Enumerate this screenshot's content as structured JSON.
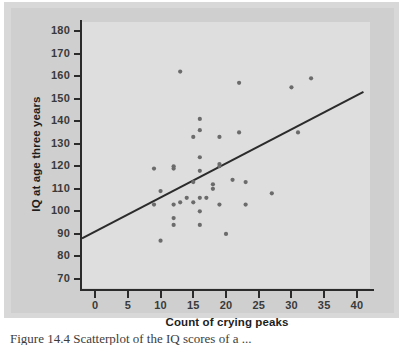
{
  "figure": {
    "caption": "Figure 14.4  Scatterplot of the IQ scores of a ..."
  },
  "chart_data": {
    "type": "scatter",
    "title": "",
    "xlabel": "Count of crying peaks",
    "ylabel": "IQ at age three years",
    "xlim": [
      -2,
      42
    ],
    "ylim": [
      66,
      184
    ],
    "xticks": [
      0,
      5,
      10,
      15,
      20,
      25,
      30,
      35,
      40
    ],
    "yticks": [
      70,
      80,
      90,
      100,
      110,
      120,
      130,
      140,
      150,
      160,
      170,
      180
    ],
    "grid": false,
    "legend": null,
    "marker_color": "#6b6b6b",
    "line_color": "#2b2b2b",
    "plot_background": "#dedede",
    "figure_background": "#cfcfcf",
    "points": [
      {
        "x": 9,
        "y": 119
      },
      {
        "x": 9,
        "y": 103
      },
      {
        "x": 10,
        "y": 109
      },
      {
        "x": 10,
        "y": 87
      },
      {
        "x": 12,
        "y": 120
      },
      {
        "x": 12,
        "y": 119
      },
      {
        "x": 12,
        "y": 103
      },
      {
        "x": 12,
        "y": 97
      },
      {
        "x": 12,
        "y": 94
      },
      {
        "x": 13,
        "y": 162
      },
      {
        "x": 13,
        "y": 104
      },
      {
        "x": 14,
        "y": 106
      },
      {
        "x": 15,
        "y": 133
      },
      {
        "x": 15,
        "y": 113
      },
      {
        "x": 15,
        "y": 104
      },
      {
        "x": 16,
        "y": 141
      },
      {
        "x": 16,
        "y": 136
      },
      {
        "x": 16,
        "y": 124
      },
      {
        "x": 16,
        "y": 118
      },
      {
        "x": 16,
        "y": 106
      },
      {
        "x": 16,
        "y": 100
      },
      {
        "x": 16,
        "y": 94
      },
      {
        "x": 17,
        "y": 106
      },
      {
        "x": 18,
        "y": 112
      },
      {
        "x": 18,
        "y": 110
      },
      {
        "x": 19,
        "y": 133
      },
      {
        "x": 19,
        "y": 121
      },
      {
        "x": 19,
        "y": 120
      },
      {
        "x": 19,
        "y": 103
      },
      {
        "x": 20,
        "y": 90
      },
      {
        "x": 21,
        "y": 114
      },
      {
        "x": 22,
        "y": 157
      },
      {
        "x": 22,
        "y": 135
      },
      {
        "x": 23,
        "y": 113
      },
      {
        "x": 23,
        "y": 103
      },
      {
        "x": 27,
        "y": 108
      },
      {
        "x": 30,
        "y": 155
      },
      {
        "x": 31,
        "y": 135
      },
      {
        "x": 33,
        "y": 159
      }
    ],
    "trend_line": {
      "type": "linear-regression",
      "x_start": -2,
      "y_start": 88,
      "x_end": 41,
      "y_end": 153
    }
  }
}
